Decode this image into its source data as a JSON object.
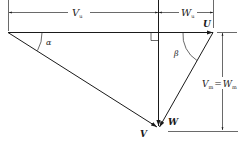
{
  "diagram": {
    "type": "velocity-triangle",
    "labels": {
      "v_u": "V",
      "v_u_sub": "u",
      "w_u": "W",
      "w_u_sub": "u",
      "u": "U",
      "alpha": "α",
      "beta": "β",
      "v": "V",
      "w": "W",
      "v_m": "V",
      "v_m_sub": "m",
      "equals": "=",
      "w_m": "W",
      "w_m_sub": "m"
    },
    "colors": {
      "line": "#1a1a1a",
      "background": "#ffffff"
    }
  }
}
